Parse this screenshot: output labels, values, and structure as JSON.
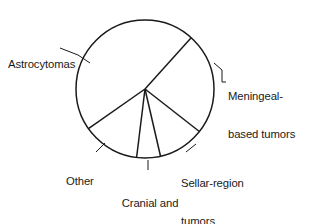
{
  "figure": {
    "background_color": "#ffffff",
    "stroke_color": "#1a1a1a",
    "text_color": "#1a1a1a"
  },
  "chart_data": {
    "type": "pie",
    "title": "",
    "subtitle": "",
    "xlabel": "",
    "ylabel": "",
    "grid": false,
    "legend_position": "none",
    "labels_placement": "outside-with-leader-lines",
    "center_x": 145,
    "center_y": 89,
    "radius": 69,
    "start_angle_deg": 42,
    "direction": "clockwise",
    "unit": "percent",
    "categories": [
      "Meningeal-based tumors",
      "Sellar-region tumors",
      "Cranial and spinal nerve tumors",
      "Other",
      "Astrocytomas"
    ],
    "values": [
      23.9,
      10.8,
      5.6,
      13.3,
      46.4
    ],
    "slices": [
      {
        "label": "Meningeal-based tumors",
        "value": 23.9,
        "sweep_deg": 86,
        "start_deg": 42,
        "end_deg": 128,
        "fill": "#ffffff",
        "stroke": "#1a1a1a"
      },
      {
        "label": "Sellar-region tumors",
        "value": 10.8,
        "sweep_deg": 39,
        "start_deg": 128,
        "end_deg": 167,
        "fill": "#ffffff",
        "stroke": "#1a1a1a"
      },
      {
        "label": "Cranial and spinal nerve tumors",
        "value": 5.6,
        "sweep_deg": 20,
        "start_deg": 167,
        "end_deg": 187,
        "fill": "#ffffff",
        "stroke": "#1a1a1a"
      },
      {
        "label": "Other",
        "value": 13.3,
        "sweep_deg": 48,
        "start_deg": 187,
        "end_deg": 235,
        "fill": "#ffffff",
        "stroke": "#1a1a1a"
      },
      {
        "label": "Astrocytomas",
        "value": 46.4,
        "sweep_deg": 167,
        "start_deg": 235,
        "end_deg": 402,
        "fill": "#ffffff",
        "stroke": "#1a1a1a"
      }
    ]
  },
  "labels": {
    "astrocytomas": "Astrocytomas",
    "meningeal_line1": "Meningeal-",
    "meningeal_line2": "based tumors",
    "sellar_line1": "Sellar-region",
    "sellar_line2": "tumors",
    "cranial_line1": "Cranial and",
    "cranial_line2": "spinal nerve",
    "cranial_line3": "tumors",
    "other": "Other"
  }
}
